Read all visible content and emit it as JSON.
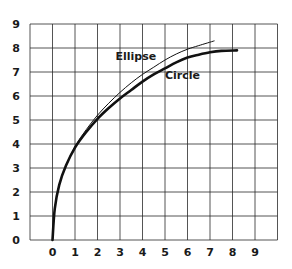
{
  "chart_data": {
    "type": "line",
    "title": "",
    "xlabel": "",
    "ylabel": "",
    "xlim": [
      -1,
      10
    ],
    "ylim": [
      0,
      9
    ],
    "grid": true,
    "x_ticks": [
      "0",
      "1",
      "2",
      "3",
      "4",
      "5",
      "6",
      "7",
      "8",
      "9"
    ],
    "y_ticks": [
      "0",
      "1",
      "2",
      "3",
      "4",
      "5",
      "6",
      "7",
      "8",
      "9"
    ],
    "legend": "none (inline labels)",
    "annotations": [
      {
        "text": "Ellipse",
        "x": 2.8,
        "y": 7.5
      },
      {
        "text": "Circle",
        "x": 5.0,
        "y": 6.7
      }
    ],
    "series": [
      {
        "name": "Ellipse",
        "style": "thin",
        "x": [
          0,
          0.1,
          0.3,
          0.6,
          1.0,
          1.5,
          2.0,
          2.5,
          3.0,
          3.5,
          4.0,
          4.5,
          5.0,
          5.5,
          6.0,
          6.5,
          7.2
        ],
        "y": [
          0,
          1.3,
          2.3,
          3.1,
          3.9,
          4.6,
          5.2,
          5.7,
          6.15,
          6.55,
          6.9,
          7.2,
          7.5,
          7.75,
          7.95,
          8.1,
          8.3
        ]
      },
      {
        "name": "Circle",
        "style": "thick",
        "x": [
          0,
          0.1,
          0.3,
          0.6,
          1.0,
          1.5,
          2.0,
          2.5,
          3.0,
          3.5,
          4.0,
          4.5,
          5.0,
          5.5,
          6.0,
          6.5,
          7.0,
          7.5,
          8.2
        ],
        "y": [
          0,
          1.3,
          2.3,
          3.1,
          3.85,
          4.5,
          5.05,
          5.5,
          5.9,
          6.25,
          6.6,
          6.9,
          7.15,
          7.4,
          7.6,
          7.72,
          7.82,
          7.88,
          7.9
        ]
      }
    ]
  },
  "colors": {
    "grid": "#2a2a2a",
    "curve": "#111111",
    "background": "#ffffff"
  }
}
